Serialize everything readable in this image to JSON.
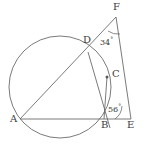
{
  "figure": {
    "stroke_color": "#6b6b6b",
    "text_color": "#3a3a3a",
    "background": "#ffffff",
    "circle": {
      "cx": 60,
      "cy": 87,
      "r": 51
    },
    "points": {
      "A": {
        "x": 20,
        "y": 119,
        "label": "A",
        "label_x": 10,
        "label_y": 115
      },
      "B": {
        "x": 104,
        "y": 119,
        "label": "B",
        "label_x": 102,
        "label_y": 121
      },
      "C": {
        "x": 107,
        "y": 77,
        "label": "C",
        "label_x": 112,
        "label_y": 70
      },
      "D": {
        "x": 88,
        "y": 52,
        "label": "D",
        "label_x": 84,
        "label_y": 36
      },
      "E": {
        "x": 131,
        "y": 119,
        "label": "E",
        "label_x": 127,
        "label_y": 121
      },
      "F": {
        "x": 116,
        "y": 17,
        "label": "F",
        "label_x": 114,
        "label_y": 3
      }
    },
    "segments": [
      {
        "name": "segment-AF",
        "from": "A",
        "to": "F"
      },
      {
        "name": "segment-DE",
        "from": "D",
        "to": "E"
      },
      {
        "name": "segment-AE",
        "from": "A",
        "to": "E"
      },
      {
        "name": "segment-BC",
        "from": "B",
        "to": "C"
      },
      {
        "name": "segment-BF",
        "from": "B",
        "to": "F"
      }
    ],
    "angles": [
      {
        "name": "angle-F",
        "vertex": "F",
        "value": "34",
        "unit": "°",
        "label_x": 100,
        "label_y": 37
      },
      {
        "name": "angle-E",
        "vertex": "E",
        "value": "56",
        "unit": "°",
        "label_x": 108,
        "label_y": 104
      }
    ]
  }
}
